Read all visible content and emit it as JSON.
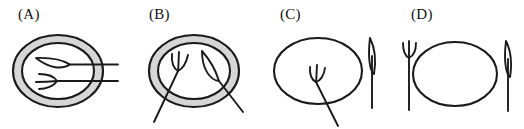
{
  "figure": {
    "kind": "line-drawing-diagram",
    "background_color": "#ffffff",
    "stroke_color": "#1a1a1a",
    "rim_fill_color": "#d6d6d6",
    "plate_fill_color": "#ffffff",
    "panel_count": 4
  },
  "panels": [
    {
      "id": "A",
      "label": "(A)",
      "plate": {
        "has_gray_rim": true,
        "rim_shade": "#d6d6d6"
      },
      "fork": {
        "present": true,
        "location": "inside-plate",
        "orientation": "horizontal",
        "tines_direction": "left",
        "handle_direction": "right",
        "handle_crosses_rim": true,
        "tine_count": 3
      },
      "knife": {
        "present": true,
        "location": "inside-plate",
        "orientation": "horizontal",
        "blade_direction": "left",
        "handle_direction": "right",
        "handle_crosses_rim": true
      }
    },
    {
      "id": "B",
      "label": "(B)",
      "plate": {
        "has_gray_rim": true,
        "rim_shade": "#d6d6d6"
      },
      "fork": {
        "present": true,
        "location": "inside-plate",
        "orientation": "diagonal",
        "tines_direction": "up",
        "handle_direction": "down-left",
        "handle_crosses_rim": true,
        "tine_count": 3
      },
      "knife": {
        "present": true,
        "location": "inside-plate",
        "orientation": "diagonal",
        "blade_direction": "up",
        "handle_direction": "down-right",
        "handle_crosses_rim": true
      }
    },
    {
      "id": "C",
      "label": "(C)",
      "plate": {
        "has_gray_rim": false,
        "rim_shade": "#ffffff"
      },
      "fork": {
        "present": true,
        "location": "inside-plate",
        "orientation": "diagonal",
        "tines_direction": "up",
        "handle_direction": "down-right",
        "handle_crosses_rim": true,
        "tine_count": 3
      },
      "knife": {
        "present": true,
        "location": "right-of-plate",
        "orientation": "vertical",
        "blade_direction": "up",
        "handle_direction": "down",
        "handle_crosses_rim": false
      }
    },
    {
      "id": "D",
      "label": "(D)",
      "plate": {
        "has_gray_rim": false,
        "rim_shade": "#ffffff"
      },
      "fork": {
        "present": true,
        "location": "left-of-plate",
        "orientation": "vertical",
        "tines_direction": "up",
        "handle_direction": "down",
        "handle_crosses_rim": false,
        "tine_count": 3
      },
      "knife": {
        "present": true,
        "location": "right-of-plate",
        "orientation": "vertical",
        "blade_direction": "up",
        "handle_direction": "down",
        "handle_crosses_rim": false
      }
    }
  ]
}
